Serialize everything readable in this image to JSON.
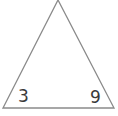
{
  "diagram": {
    "shape": "triangle",
    "stroke_color": "#8a8a8a",
    "background": "#ffffff",
    "vertices": {
      "apex": [
        58,
        0
      ],
      "bottom_left": [
        3,
        108
      ],
      "bottom_right": [
        114,
        108
      ]
    },
    "labels": {
      "bottom_left": "3",
      "bottom_right": "9"
    }
  }
}
